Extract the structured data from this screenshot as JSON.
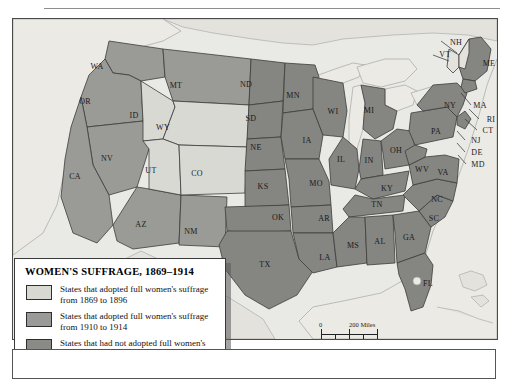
{
  "figure": {
    "kind": "thematic-choropleth-map",
    "region": "Contiguous United States"
  },
  "legend": {
    "title": "WOMEN'S SUFFRAGE, 1869–1914",
    "entries": [
      {
        "swatch_color": "#d9d9d4",
        "label": "States that adopted full women's suffrage from 1869 to 1896"
      },
      {
        "swatch_color": "#9a9a96",
        "label": "States that adopted full women's suffrage from 1910 to 1914"
      },
      {
        "swatch_color": "#8a8a86",
        "label": "States that had not adopted full women's suffrage by 1914"
      }
    ]
  },
  "scale_bar": {
    "zero_top": "0",
    "miles": "200 Miles",
    "zero_bottom": "0",
    "kilometers": "200 Kilometers"
  },
  "colors": {
    "early_adopter": "#d9d9d4",
    "late_adopter": "#9a9a96",
    "not_adopted": "#858581",
    "water": "#eceae5",
    "land_outside": "#e4e2dd",
    "border": "#3c3c3c",
    "frame": "#4a4a4a",
    "map_background": "#e9e9e6"
  },
  "chart_data": {
    "type": "map",
    "title": "WOMEN'S SUFFRAGE, 1869–1914",
    "categories": [
      "1869–1896",
      "1910–1914",
      "not by 1914"
    ],
    "states": [
      {
        "code": "WA",
        "x": 84,
        "y": 47,
        "category": "1910-1914"
      },
      {
        "code": "OR",
        "x": 72,
        "y": 82,
        "category": "1910-1914"
      },
      {
        "code": "ID",
        "x": 121,
        "y": 96,
        "category": "1869-1896"
      },
      {
        "code": "MT",
        "x": 163,
        "y": 66,
        "category": "1910-1914"
      },
      {
        "code": "WY",
        "x": 150,
        "y": 108,
        "category": "1869-1896"
      },
      {
        "code": "NV",
        "x": 94,
        "y": 139,
        "category": "1910-1914"
      },
      {
        "code": "CA",
        "x": 62,
        "y": 157,
        "category": "1910-1914"
      },
      {
        "code": "UT",
        "x": 138,
        "y": 151,
        "category": "1869-1896"
      },
      {
        "code": "CO",
        "x": 184,
        "y": 154,
        "category": "1869-1896"
      },
      {
        "code": "AZ",
        "x": 128,
        "y": 205,
        "category": "1910-1914"
      },
      {
        "code": "NM",
        "x": 178,
        "y": 212,
        "category": "1910-1914"
      },
      {
        "code": "ND",
        "x": 233,
        "y": 65,
        "category": "not by 1914"
      },
      {
        "code": "SD",
        "x": 238,
        "y": 99,
        "category": "not by 1914"
      },
      {
        "code": "NE",
        "x": 243,
        "y": 128,
        "category": "not by 1914"
      },
      {
        "code": "KS",
        "x": 250,
        "y": 167,
        "category": "not by 1914"
      },
      {
        "code": "OK",
        "x": 265,
        "y": 198,
        "category": "not by 1914"
      },
      {
        "code": "TX",
        "x": 252,
        "y": 245,
        "category": "not by 1914"
      },
      {
        "code": "MN",
        "x": 280,
        "y": 76,
        "category": "not by 1914"
      },
      {
        "code": "IA",
        "x": 294,
        "y": 121,
        "category": "not by 1914"
      },
      {
        "code": "MO",
        "x": 303,
        "y": 164,
        "category": "not by 1914"
      },
      {
        "code": "AR",
        "x": 311,
        "y": 199,
        "category": "not by 1914"
      },
      {
        "code": "LA",
        "x": 312,
        "y": 238,
        "category": "not by 1914"
      },
      {
        "code": "WI",
        "x": 320,
        "y": 92,
        "category": "not by 1914"
      },
      {
        "code": "IL",
        "x": 328,
        "y": 140,
        "category": "not by 1914"
      },
      {
        "code": "MI",
        "x": 356,
        "y": 91,
        "category": "not by 1914"
      },
      {
        "code": "IN",
        "x": 356,
        "y": 141,
        "category": "not by 1914"
      },
      {
        "code": "OH",
        "x": 383,
        "y": 131,
        "category": "not by 1914"
      },
      {
        "code": "KY",
        "x": 374,
        "y": 169,
        "category": "not by 1914"
      },
      {
        "code": "TN",
        "x": 364,
        "y": 185,
        "category": "not by 1914"
      },
      {
        "code": "MS",
        "x": 340,
        "y": 226,
        "category": "not by 1914"
      },
      {
        "code": "AL",
        "x": 367,
        "y": 222,
        "category": "not by 1914"
      },
      {
        "code": "GA",
        "x": 396,
        "y": 218,
        "category": "not by 1914"
      },
      {
        "code": "FL",
        "x": 415,
        "y": 264,
        "category": "not by 1914"
      },
      {
        "code": "SC",
        "x": 421,
        "y": 199,
        "category": "not by 1914"
      },
      {
        "code": "NC",
        "x": 424,
        "y": 180,
        "category": "not by 1914"
      },
      {
        "code": "VA",
        "x": 430,
        "y": 153,
        "category": "not by 1914"
      },
      {
        "code": "WV",
        "x": 409,
        "y": 150,
        "category": "not by 1914"
      },
      {
        "code": "PA",
        "x": 423,
        "y": 112,
        "category": "not by 1914"
      },
      {
        "code": "NY",
        "x": 437,
        "y": 86,
        "category": "not by 1914"
      },
      {
        "code": "ME",
        "x": 476,
        "y": 44,
        "category": "not by 1914"
      },
      {
        "code": "NH",
        "x": 443,
        "y": 23,
        "category": "not by 1914"
      },
      {
        "code": "VT",
        "x": 432,
        "y": 35,
        "category": "not by 1914"
      },
      {
        "code": "MA",
        "x": 467,
        "y": 86,
        "category": "not by 1914"
      },
      {
        "code": "RI",
        "x": 478,
        "y": 100,
        "category": "not by 1914"
      },
      {
        "code": "CT",
        "x": 475,
        "y": 111,
        "category": "not by 1914"
      },
      {
        "code": "NJ",
        "x": 463,
        "y": 121,
        "category": "not by 1914"
      },
      {
        "code": "DE",
        "x": 464,
        "y": 133,
        "category": "not by 1914"
      },
      {
        "code": "MD",
        "x": 465,
        "y": 145,
        "category": "not by 1914"
      }
    ]
  }
}
